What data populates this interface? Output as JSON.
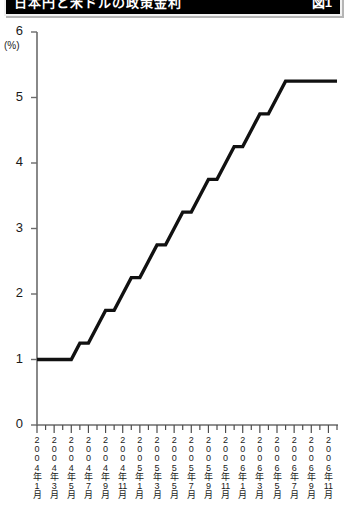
{
  "banner": {
    "title": "日本円と米ドルの政策金利",
    "title_right": "図1"
  },
  "chart_data": {
    "type": "line",
    "title": "日本円と米ドルの政策金利",
    "xlabel": "",
    "ylabel": "",
    "yunit": "(%)",
    "ylim": [
      0,
      6
    ],
    "yticks": [
      0,
      1,
      2,
      3,
      4,
      5,
      6
    ],
    "ytick_labels": [
      "0",
      "1",
      "2",
      "3",
      "4",
      "5",
      "6"
    ],
    "grid": false,
    "legend": "none",
    "x_tick_labels": [
      "2\n0\n0\n4\n年\n1\n月",
      "2\n0\n0\n4\n年\n3\n月",
      "2\n0\n0\n4\n年\n5\n月",
      "2\n0\n0\n4\n年\n7\n月",
      "2\n0\n0\n4\n年\n9\n月",
      "2\n0\n0\n4\n年\n11\n月",
      "2\n0\n0\n5\n年\n1\n月",
      "2\n0\n0\n5\n年\n3\n月",
      "2\n0\n0\n5\n年\n5\n月",
      "2\n0\n0\n5\n年\n7\n月",
      "2\n0\n0\n5\n年\n9\n月",
      "2\n0\n0\n5\n年\n11\n月",
      "2\n0\n0\n6\n年\n1\n月",
      "2\n0\n0\n6\n年\n3\n月",
      "2\n0\n0\n6\n年\n5\n月",
      "2\n0\n0\n6\n年\n7\n月",
      "2\n0\n0\n6\n年\n9\n月",
      "2\n0\n0\n6\n年\n11\n月"
    ],
    "x": [
      "2004-01",
      "2004-02",
      "2004-03",
      "2004-04",
      "2004-05",
      "2004-06",
      "2004-07",
      "2004-08",
      "2004-09",
      "2004-10",
      "2004-11",
      "2004-12",
      "2005-01",
      "2005-02",
      "2005-03",
      "2005-04",
      "2005-05",
      "2005-06",
      "2005-07",
      "2005-08",
      "2005-09",
      "2005-10",
      "2005-11",
      "2005-12",
      "2006-01",
      "2006-02",
      "2006-03",
      "2006-04",
      "2006-05",
      "2006-06",
      "2006-07",
      "2006-08",
      "2006-09",
      "2006-10",
      "2006-11",
      "2006-12"
    ],
    "series": [
      {
        "name": "米ドル政策金利",
        "color": "#111111",
        "values": [
          1.0,
          1.0,
          1.0,
          1.0,
          1.0,
          1.25,
          1.25,
          1.5,
          1.75,
          1.75,
          2.0,
          2.25,
          2.25,
          2.5,
          2.75,
          2.75,
          3.0,
          3.25,
          3.25,
          3.5,
          3.75,
          3.75,
          4.0,
          4.25,
          4.25,
          4.5,
          4.75,
          4.75,
          5.0,
          5.25,
          5.25,
          5.25,
          5.25,
          5.25,
          5.25,
          5.25
        ]
      }
    ]
  }
}
